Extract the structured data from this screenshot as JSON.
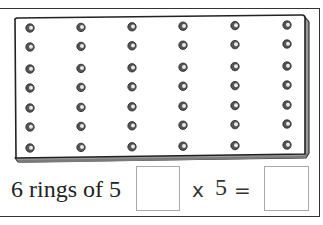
{
  "pegboard": {
    "columns": 6,
    "rows": 7,
    "peg_x": [
      30,
      81,
      132,
      183,
      235,
      287
    ],
    "peg_y": [
      28,
      47,
      69,
      88,
      108,
      127,
      148
    ]
  },
  "equation": {
    "label": "6 rings of 5",
    "answer_box_1": "",
    "times_symbol": "x",
    "multiplier": "5",
    "equals_symbol": "=",
    "answer_box_2": ""
  }
}
